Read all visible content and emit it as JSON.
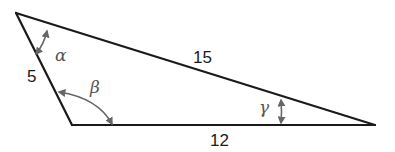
{
  "diagram": {
    "type": "triangle",
    "vertices": {
      "top_left": {
        "x": 16,
        "y": 13
      },
      "bottom_left": {
        "x": 72,
        "y": 125
      },
      "right": {
        "x": 375,
        "y": 125
      }
    },
    "sides": [
      {
        "id": "left",
        "label": "5",
        "from": "top_left",
        "to": "bottom_left"
      },
      {
        "id": "hypotenuse",
        "label": "15",
        "from": "top_left",
        "to": "right"
      },
      {
        "id": "base",
        "label": "12",
        "from": "bottom_left",
        "to": "right"
      }
    ],
    "angles": [
      {
        "id": "alpha",
        "label": "α",
        "vertex": "top_left"
      },
      {
        "id": "beta",
        "label": "β",
        "vertex": "bottom_left"
      },
      {
        "id": "gamma",
        "label": "γ",
        "vertex": "right"
      }
    ],
    "colors": {
      "edge": "#1a1a1a",
      "arc": "#666666",
      "angle_label": "#555555"
    }
  }
}
